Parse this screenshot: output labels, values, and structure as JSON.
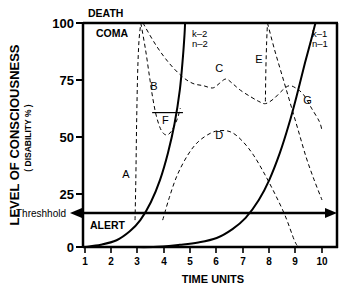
{
  "chart_data": {
    "type": "line",
    "title": "",
    "xlabel": "TIME   UNITS",
    "ylabel_main": "LEVEL  OF  CONSCIOUSNESS",
    "ylabel_sub": "( DISABILITY  % )",
    "xlim": [
      1,
      10
    ],
    "ylim": [
      0,
      100
    ],
    "grid": false,
    "x_ticks": [
      "1",
      "2",
      "3",
      "4",
      "5",
      "6",
      "7",
      "8",
      "9",
      "10"
    ],
    "y_ticks": [
      "0",
      "25",
      "50",
      "75",
      "100"
    ],
    "annotations": {
      "death": "DEATH",
      "coma": "COMA",
      "alert": "ALERT",
      "threshold": "Threshhold",
      "k2": "k–2",
      "n2": "n–2",
      "k1": "k–1",
      "n1": "n–1"
    },
    "threshold_value": 12,
    "curve_labels": [
      {
        "id": "A",
        "label": "A",
        "x": 2.55,
        "y": 31
      },
      {
        "id": "B",
        "label": "B",
        "x": 3.62,
        "y": 70
      },
      {
        "id": "C",
        "label": "C",
        "x": 6.1,
        "y": 78
      },
      {
        "id": "D",
        "label": "D",
        "x": 6.1,
        "y": 48
      },
      {
        "id": "E",
        "label": "E",
        "x": 7.6,
        "y": 82
      },
      {
        "id": "F",
        "label": "F",
        "x": 4.05,
        "y": 55
      },
      {
        "id": "G",
        "label": "G",
        "x": 9.45,
        "y": 64
      }
    ],
    "series": [
      {
        "name": "A",
        "style": "dashed",
        "points": [
          [
            2.9,
            12
          ],
          [
            2.93,
            30
          ],
          [
            2.96,
            55
          ],
          [
            3.0,
            78
          ],
          [
            3.05,
            92
          ],
          [
            3.12,
            100
          ]
        ]
      },
      {
        "name": "B",
        "style": "dashed",
        "points": [
          [
            3.12,
            100
          ],
          [
            3.3,
            88
          ],
          [
            3.45,
            76
          ],
          [
            3.58,
            66
          ],
          [
            3.72,
            58
          ],
          [
            3.9,
            52
          ],
          [
            4.1,
            50
          ],
          [
            4.3,
            52
          ],
          [
            4.5,
            57
          ],
          [
            4.62,
            62
          ]
        ]
      },
      {
        "name": "C",
        "style": "dashed",
        "points": [
          [
            3.2,
            100
          ],
          [
            3.7,
            90
          ],
          [
            4.2,
            82
          ],
          [
            4.7,
            76
          ],
          [
            5.1,
            73
          ],
          [
            5.5,
            72
          ],
          [
            5.85,
            71
          ],
          [
            6.1,
            73
          ],
          [
            6.35,
            75
          ],
          [
            6.6,
            73
          ],
          [
            6.9,
            70
          ],
          [
            7.3,
            67
          ],
          [
            7.6,
            65
          ],
          [
            7.85,
            64
          ],
          [
            8.15,
            66
          ],
          [
            8.5,
            70
          ],
          [
            8.75,
            72
          ],
          [
            9.0,
            71
          ],
          [
            9.3,
            68
          ],
          [
            9.6,
            62
          ],
          [
            9.9,
            56
          ],
          [
            10,
            52
          ]
        ]
      },
      {
        "name": "D",
        "style": "dashed",
        "points": [
          [
            3.95,
            12
          ],
          [
            4.2,
            22
          ],
          [
            4.5,
            32
          ],
          [
            4.9,
            41
          ],
          [
            5.3,
            47
          ],
          [
            5.8,
            51
          ],
          [
            6.2,
            52
          ],
          [
            6.6,
            51
          ],
          [
            7.0,
            47
          ],
          [
            7.4,
            41
          ],
          [
            7.8,
            33
          ],
          [
            8.2,
            24
          ],
          [
            8.6,
            14
          ],
          [
            8.95,
            3
          ],
          [
            9.1,
            0
          ]
        ]
      },
      {
        "name": "E",
        "style": "dashed",
        "points": [
          [
            7.85,
            65
          ],
          [
            7.87,
            80
          ],
          [
            7.9,
            92
          ],
          [
            7.93,
            100
          ]
        ]
      },
      {
        "name": "E2",
        "style": "dashed",
        "points": [
          [
            7.93,
            100
          ],
          [
            8.2,
            88
          ],
          [
            8.5,
            76
          ],
          [
            8.8,
            64
          ],
          [
            9.1,
            52
          ],
          [
            9.4,
            40
          ],
          [
            9.7,
            30
          ],
          [
            10,
            21
          ]
        ]
      },
      {
        "name": "F",
        "style": "solid-thin",
        "points": [
          [
            3.55,
            60
          ],
          [
            4.72,
            60
          ]
        ]
      },
      {
        "name": "k2n2",
        "style": "solid",
        "points": [
          [
            1.0,
            0
          ],
          [
            1.6,
            1
          ],
          [
            2.2,
            3
          ],
          [
            2.7,
            7
          ],
          [
            3.1,
            12
          ],
          [
            3.5,
            20
          ],
          [
            3.85,
            30
          ],
          [
            4.15,
            42
          ],
          [
            4.4,
            55
          ],
          [
            4.6,
            70
          ],
          [
            4.72,
            85
          ],
          [
            4.78,
            95
          ],
          [
            4.8,
            100
          ]
        ]
      },
      {
        "name": "k1n1",
        "style": "solid",
        "points": [
          [
            1.0,
            0
          ],
          [
            2.5,
            0
          ],
          [
            3.6,
            0
          ],
          [
            4.6,
            1
          ],
          [
            5.3,
            2
          ],
          [
            6.0,
            4
          ],
          [
            6.6,
            8
          ],
          [
            7.1,
            13
          ],
          [
            7.6,
            21
          ],
          [
            8.0,
            30
          ],
          [
            8.4,
            42
          ],
          [
            8.75,
            55
          ],
          [
            9.05,
            68
          ],
          [
            9.35,
            82
          ],
          [
            9.6,
            93
          ],
          [
            9.75,
            100
          ]
        ]
      }
    ]
  }
}
